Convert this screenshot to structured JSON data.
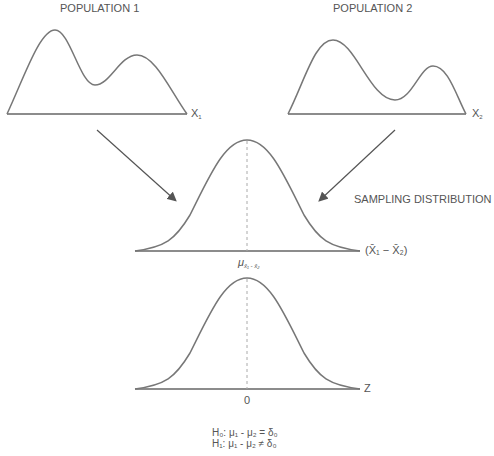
{
  "diagram": {
    "population1": {
      "title": "POPULATION 1",
      "axis_label": "X",
      "axis_sub": "1"
    },
    "population2": {
      "title": "POPULATION 2",
      "axis_label": "X",
      "axis_sub": "2"
    },
    "sampling": {
      "title": "SAMPLING DISTRIBUTION",
      "axis_label": "(X̄₁ − X̄₂)",
      "center_label": "μ",
      "center_sub": "x̄₁ - x̄₂"
    },
    "standard": {
      "axis_label": "Z",
      "center_label": "0"
    },
    "hypotheses": {
      "h0": "H₀: μ₁ - μ₂ = δ₀",
      "h1": "H₁: μ₁ - μ₂ ≠ δ₀"
    },
    "colors": {
      "curve": "#777777",
      "axis": "#666666",
      "arrow": "#555555",
      "dashed": "#aaaaaa"
    }
  }
}
